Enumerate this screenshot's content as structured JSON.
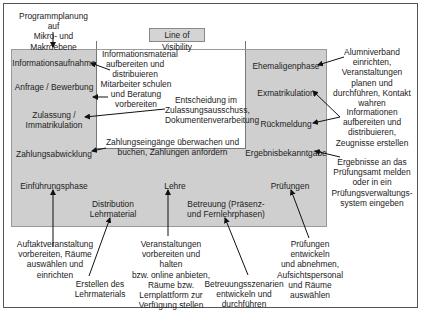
{
  "title": "Line of Visibility",
  "top_note": "Programmplanung auf\nMikro- und Makroebene",
  "visible_activities": {
    "left": [
      "Informationsaufnahme",
      "Anfrage / Bewerbung",
      "Zulassung /\nImmatrikulation",
      "Zahlungsabwicklung"
    ],
    "bottom": [
      "Einführungsphase",
      "Distribution\nLehrmaterial",
      "Lehre",
      "Betreuung (Präsenz-\nund Fernlehrphasen)",
      "Prüfungen"
    ],
    "right": [
      "Ehemaligenphase",
      "Exmatrikulation",
      "Rückmeldung",
      "Ergebnisbekanntgabe"
    ]
  },
  "backstage_notes": {
    "info_material": "Informationsmaterial\naufbereiten und\ndistribuieren",
    "staff_training": "Mitarbeiter schulen\nund Beratung\nvorbereiten",
    "admission": "Entscheidung im\nZulassungsausschuss,\nDokumentenverarbeitung",
    "payments": "Zahlungseingänge überwachen und\nbuchen, Zahlungen anfordern",
    "alumni": "Alumniverband\neinrichten,\nVeranstaltungen\nplanen und\ndurchführen, Kontakt\nwahren",
    "re_registration": "Informationen\naufbereiten und\ndistribuieren,\nZeugnisse erstellen",
    "results": "Ergebnisse an das\nPrüfungsamt melden\noder in ein\nPrüfungsverwaltungs-\nsystem eingeben",
    "kickoff": "Auftaktveranstaltung\nvorbereiten, Räume\nauswählen und\neinrichten",
    "materials": "Erstellen des\nLehrmaterials",
    "teaching": "Veranstaltungen\nvorbereiten und halten\nbzw. online anbieten,\nRäume bzw.\nLernplattform zur\nVerfügung stellen",
    "support": "Betreuungsszenarien\nentwickeln und\ndurchführen",
    "exams": "Prüfungen entwickeln\nund abnehmen,\nAufsichtspersonal\nund Räume\nauswählen"
  },
  "colors": {
    "visible_zone": "#cfcfcf",
    "background": "#ffffff",
    "border": "#555555",
    "arrow": "#111111"
  }
}
